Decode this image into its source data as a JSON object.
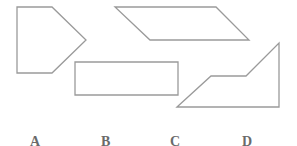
{
  "figure": {
    "stroke_color": "#9a9a9a",
    "shapes": [
      {
        "name": "pentagon",
        "points": "17,7 52,7 86,40 52,73 17,73"
      },
      {
        "name": "parallelogram",
        "points": "115,7 216,7 249,40 150,40"
      },
      {
        "name": "rectangle",
        "points": "75,62 178,62 178,95 75,95"
      },
      {
        "name": "trapezoid",
        "points": "177,107 211,76 246,76 279,43 279,107"
      }
    ]
  },
  "options": [
    {
      "letter": "A",
      "value": "1"
    },
    {
      "letter": "B",
      "value": "2"
    },
    {
      "letter": "C",
      "value": "3"
    },
    {
      "letter": "D",
      "value": "4"
    }
  ]
}
